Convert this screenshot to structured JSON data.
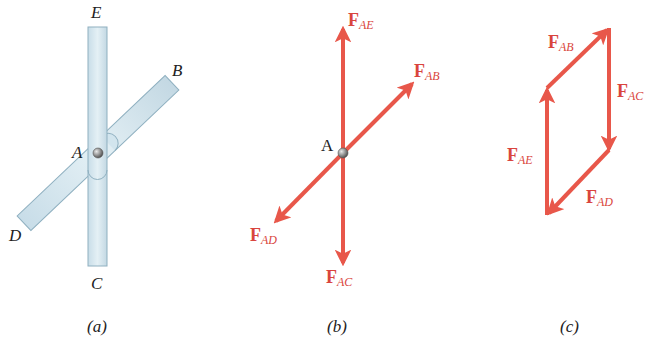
{
  "colors": {
    "force": "#e8574a",
    "force_label": "#d9453d",
    "bar_fill": "#d6e7ef",
    "bar_stroke": "#8fb0c0",
    "pin": "#9a9a9a",
    "text": "#222222"
  },
  "panel_a": {
    "caption": "(a)",
    "points": {
      "E": "E",
      "B": "B",
      "A": "A",
      "D": "D",
      "C": "C"
    }
  },
  "panel_b": {
    "caption": "(b)",
    "joint_label": "A",
    "forces": [
      {
        "id": "AE",
        "F": "F",
        "sub": "AE"
      },
      {
        "id": "AB",
        "F": "F",
        "sub": "AB"
      },
      {
        "id": "AD",
        "F": "F",
        "sub": "AD"
      },
      {
        "id": "AC",
        "F": "F",
        "sub": "AC"
      }
    ]
  },
  "panel_c": {
    "caption": "(c)",
    "forces": [
      {
        "id": "AB",
        "F": "F",
        "sub": "AB"
      },
      {
        "id": "AC",
        "F": "F",
        "sub": "AC"
      },
      {
        "id": "AE",
        "F": "F",
        "sub": "AE"
      },
      {
        "id": "AD",
        "F": "F",
        "sub": "AD"
      }
    ]
  }
}
